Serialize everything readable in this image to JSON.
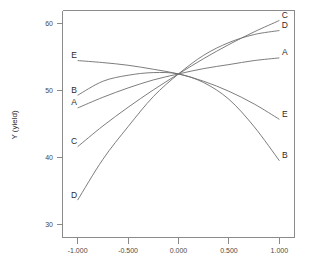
{
  "chart_data": {
    "type": "line",
    "title": "",
    "xlabel": "",
    "ylabel": "Y (yield)",
    "xlim": [
      -1.15,
      1.15
    ],
    "ylim": [
      28.0,
      62.0
    ],
    "grid": false,
    "legend_position": "inline-endpoint-labels",
    "xticks": [
      -1.0,
      -0.5,
      0.0,
      0.5,
      1.0
    ],
    "xtick_labels": [
      "-1.000",
      "-0.500",
      "0.000",
      "0.500",
      "1.000"
    ],
    "yticks": [
      30,
      40,
      50,
      60
    ],
    "ytick_labels": [
      "30",
      "40",
      "50",
      "60"
    ],
    "center_value": 52.5,
    "x": [
      -1.0,
      -0.75,
      -0.5,
      -0.25,
      0.0,
      0.25,
      0.5,
      0.75,
      1.0
    ],
    "series": [
      {
        "name": "A",
        "label_left": "A",
        "label_right": "A",
        "values": [
          47.4,
          49.0,
          50.4,
          51.6,
          52.5,
          53.3,
          53.9,
          54.5,
          54.9
        ]
      },
      {
        "name": "B",
        "label_left": "B",
        "label_right": "B",
        "values": [
          49.3,
          51.4,
          52.3,
          52.7,
          52.5,
          51.2,
          48.7,
          44.6,
          39.5
        ]
      },
      {
        "name": "C",
        "label_left": "C",
        "label_right": "C",
        "values": [
          41.6,
          44.7,
          47.5,
          50.1,
          52.5,
          54.8,
          56.9,
          58.8,
          60.5
        ]
      },
      {
        "name": "D",
        "label_left": "D",
        "label_right": "D",
        "values": [
          33.6,
          39.7,
          44.6,
          49.1,
          52.5,
          55.3,
          57.2,
          58.4,
          59.0
        ]
      },
      {
        "name": "E",
        "label_left": "E",
        "label_right": "E",
        "values": [
          54.5,
          54.2,
          53.8,
          53.2,
          52.5,
          51.4,
          49.9,
          48.0,
          45.7
        ]
      }
    ]
  },
  "axis": {
    "y_title": "Y (yield)"
  }
}
